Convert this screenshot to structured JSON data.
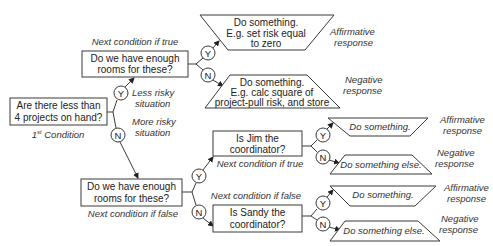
{
  "start": {
    "lines": [
      "Are there less than",
      "4 projects on hand?"
    ],
    "caption_super": "st",
    "caption_prefix": "1",
    "caption_rest": " Condition"
  },
  "branch_labels": {
    "yes": "Y",
    "no": "N"
  },
  "less_risky": [
    "Less risky",
    "situation"
  ],
  "more_risky": [
    "More risky",
    "situation"
  ],
  "cond_top": {
    "lines": [
      "Do we have enough",
      "rooms for these?"
    ],
    "caption": "Next condition if true"
  },
  "cond_bottom": {
    "lines": [
      "Do we have enough",
      "rooms for these?"
    ],
    "caption": "Next condition if false"
  },
  "action_top_yes": {
    "lines": [
      "Do something.",
      "E.g. set risk equal",
      "to zero"
    ],
    "response": [
      "Affirmative",
      "response"
    ]
  },
  "action_top_no": {
    "lines": [
      "Do something.",
      "E.g. calc square of",
      "project-pull risk, and store"
    ],
    "response": [
      "Negative",
      "response"
    ]
  },
  "cond_jim": {
    "lines": [
      "Is Jim the",
      "coordinator?"
    ],
    "caption": "Next condition if true"
  },
  "cond_sandy": {
    "lines": [
      "Is Sandy the",
      "coordinator?"
    ],
    "caption": "Next condition if false"
  },
  "jim_yes": {
    "text": "Do something.",
    "response": [
      "Affirmative",
      "response"
    ]
  },
  "jim_no": {
    "text": "Do something else.",
    "response": [
      "Negative",
      "response"
    ]
  },
  "sandy_yes": {
    "text": "Do something.",
    "response": [
      "Affirmative",
      "response"
    ]
  },
  "sandy_no": {
    "text": "Do something else.",
    "response": [
      "Negative",
      "response"
    ]
  }
}
